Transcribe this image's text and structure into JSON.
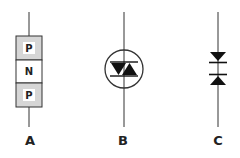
{
  "diagram": {
    "title": "",
    "colors": {
      "stroke": "#333333",
      "fill_dark": "#111111",
      "p_region_fill": "#d6d6d6",
      "background": "#ffffff"
    },
    "symbols": [
      {
        "id": "A",
        "label": "A",
        "type": "pnp-layer-structure",
        "layers": [
          "P",
          "N",
          "P"
        ]
      },
      {
        "id": "B",
        "label": "B",
        "type": "diac-in-circle",
        "description": "two opposed triangles between two bars, enclosed in a circle"
      },
      {
        "id": "C",
        "label": "C",
        "type": "diac-stacked",
        "description": "two opposed triangles stacked vertically with bars"
      }
    ]
  }
}
